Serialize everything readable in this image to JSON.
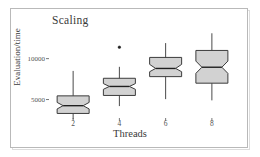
{
  "figure": {
    "title": "Scaling",
    "xlabel": "Threads",
    "ylabel": "Evaluation/time"
  },
  "axis": {
    "yticks": [
      {
        "label": "10000",
        "value": 10000
      },
      {
        "label": "5000",
        "value": 5000
      }
    ],
    "xticks": [
      {
        "label": "2",
        "value": 2
      },
      {
        "label": "4",
        "value": 4
      },
      {
        "label": "6",
        "value": 6
      },
      {
        "label": "8",
        "value": 8
      }
    ]
  },
  "colors": {
    "box_fill": "#d2d2d2",
    "box_stroke": "#3c3c3c",
    "median_stroke": "#202020",
    "whisker_stroke": "#4a4a4a",
    "frame": "#b9b9b9",
    "text": "#3a3a3a",
    "outlier": "#202020",
    "background": "#ffffff"
  },
  "chart_data": {
    "type": "box",
    "title": "Scaling",
    "xlabel": "Threads",
    "ylabel": "Evaluation/time",
    "categories": [
      "2",
      "4",
      "6",
      "8"
    ],
    "grid": false,
    "legend": "none",
    "xlim": [
      1,
      9
    ],
    "ylim": [
      2500,
      13500
    ],
    "notched": true,
    "boxes": [
      {
        "category": "2",
        "x": 2,
        "whisker_low": 2600,
        "q1": 3300,
        "median": 4250,
        "q3": 5450,
        "whisker_high": 8500,
        "notch_low": 3850,
        "notch_high": 4650,
        "outliers": []
      },
      {
        "category": "4",
        "x": 4,
        "whisker_low": 4200,
        "q1": 5500,
        "median": 6600,
        "q3": 7600,
        "whisker_high": 9000,
        "notch_low": 6250,
        "notch_high": 6950,
        "outliers": [
          11400
        ]
      },
      {
        "category": "6",
        "x": 6,
        "whisker_low": 5050,
        "q1": 7800,
        "median": 8800,
        "q3": 10150,
        "whisker_high": 11900,
        "notch_low": 8400,
        "notch_high": 9300,
        "outliers": []
      },
      {
        "category": "8",
        "x": 8,
        "whisker_low": 4900,
        "q1": 7000,
        "median": 8950,
        "q3": 11000,
        "whisker_high": 13100,
        "notch_low": 8200,
        "notch_high": 9700,
        "outliers": []
      }
    ]
  }
}
